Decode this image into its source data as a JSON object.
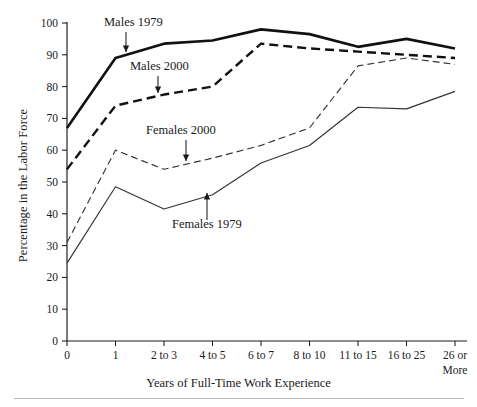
{
  "chart_data": {
    "type": "line",
    "title": "",
    "xlabel": "Years of Full-Time Work Experience",
    "ylabel": "Percentage in the Labor Force",
    "categories": [
      "0",
      "1",
      "2 to 3",
      "4 to 5",
      "6 to 7",
      "8 to 10",
      "11 to 15",
      "16 to 25",
      "26 or\nMore"
    ],
    "category_labels_display": [
      "0",
      "1",
      "2 to 3",
      "4 to 5",
      "6 to 7",
      "8 to 10",
      "11 to 15",
      "16 to 25",
      "26 or",
      "More"
    ],
    "ylim": [
      0,
      100
    ],
    "yticks": [
      0,
      10,
      20,
      30,
      40,
      50,
      60,
      70,
      80,
      90,
      100
    ],
    "grid": false,
    "legend_position": "inline-annotations",
    "series": [
      {
        "name": "Males 1979",
        "style": "solid-thick",
        "color": "#111111",
        "width": 2.6,
        "values": [
          67,
          89,
          93.5,
          94.5,
          98,
          96.5,
          92.5,
          95,
          92
        ]
      },
      {
        "name": "Males 2000",
        "style": "dashed-thick",
        "color": "#111111",
        "width": 2.4,
        "dash": "9,5",
        "values": [
          54,
          74,
          77.5,
          80,
          93.5,
          92,
          91,
          90,
          89
        ]
      },
      {
        "name": "Females 2000",
        "style": "dashed-thin",
        "color": "#333333",
        "width": 1.15,
        "dash": "7,4",
        "values": [
          31,
          60,
          54,
          57.5,
          61.5,
          67,
          86.5,
          89,
          87
        ]
      },
      {
        "name": "Females 1979",
        "style": "solid-thin",
        "color": "#333333",
        "width": 1.15,
        "values": [
          24.5,
          48.5,
          41.5,
          46,
          56,
          61.5,
          73.5,
          73,
          78.5
        ]
      }
    ],
    "annotations": [
      {
        "label": "Males 1979",
        "target_category": "1",
        "target_value": 89,
        "text_x": 104,
        "text_y": 26,
        "arrow_from_x": 126,
        "arrow_from_y": 32,
        "arrow_to_x": 126,
        "arrow_to_y": 52,
        "direction": "down"
      },
      {
        "label": "Males 2000",
        "target_category": "2 to 3",
        "target_value": 77.5,
        "text_x": 130,
        "text_y": 70,
        "arrow_from_x": 158,
        "arrow_from_y": 76,
        "arrow_to_x": 158,
        "arrow_to_y": 93,
        "direction": "down"
      },
      {
        "label": "Females 2000",
        "target_category": "3.5",
        "target_value": 56,
        "text_x": 146,
        "text_y": 134,
        "arrow_from_x": 186,
        "arrow_from_y": 140,
        "arrow_to_x": 186,
        "arrow_to_y": 161,
        "direction": "down"
      },
      {
        "label": "Females 1979",
        "target_category": "4 to 5",
        "target_value": 46,
        "text_x": 172,
        "text_y": 228,
        "arrow_from_x": 207,
        "arrow_from_y": 220,
        "arrow_to_x": 207,
        "arrow_to_y": 193,
        "direction": "up"
      }
    ]
  },
  "figure": {
    "y_axis_title": "Percentage in the Labor Force",
    "x_axis_title": "Years of Full-Time Work Experience"
  }
}
